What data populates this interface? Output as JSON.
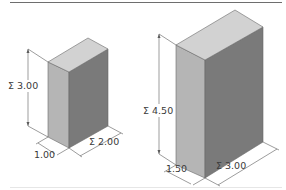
{
  "figure": {
    "top_rule_color": "#6e6e6e",
    "bottom_rule_color": "#e6e6e6",
    "face_colors": {
      "top": "#d2d2d2",
      "left": "#b5b5b5",
      "right": "#7a7a7a",
      "edge": "#6a6a6a"
    },
    "dimension_line_color": "#5a5a5a"
  },
  "boxes": [
    {
      "name": "small-box",
      "height_label": "Σ 3.00",
      "depth_label": "1.00",
      "width_label": "Σ 2.00",
      "dimensions": {
        "height": 3.0,
        "depth": 1.0,
        "width": 2.0
      }
    },
    {
      "name": "large-box",
      "height_label": "Σ 4.50",
      "depth_label": "1.50",
      "width_label": "Σ 3.00",
      "dimensions": {
        "height": 4.5,
        "depth": 1.5,
        "width": 3.0
      }
    }
  ]
}
